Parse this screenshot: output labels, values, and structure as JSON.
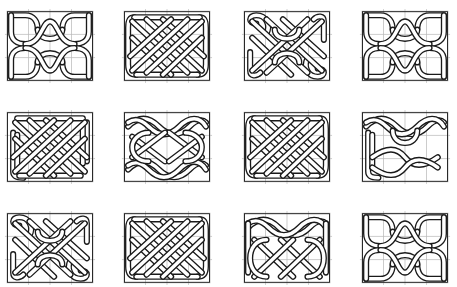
{
  "figure": {
    "title": "",
    "colors": {
      "line": "#1a1a1a",
      "band": "#ffffff",
      "grid": "#b8b8b8",
      "background": "#ffffff"
    },
    "grid": {
      "columns": 4,
      "rows": 3,
      "cell_cols": 4,
      "cell_rows": 3
    },
    "panels": [
      {
        "id": 1,
        "row": 1,
        "col": 1,
        "x": 7,
        "y": 11,
        "variant": "corner-loops-center-arcs"
      },
      {
        "id": 2,
        "row": 1,
        "col": 2,
        "x": 124,
        "y": 11,
        "variant": "diagonal-plait-framed"
      },
      {
        "id": 3,
        "row": 1,
        "col": 3,
        "x": 244,
        "y": 11,
        "variant": "spiral-ends-plait"
      },
      {
        "id": 4,
        "row": 1,
        "col": 4,
        "x": 362,
        "y": 11,
        "variant": "corner-loops-center-arcs"
      },
      {
        "id": 5,
        "row": 2,
        "col": 1,
        "x": 7,
        "y": 112,
        "variant": "side-bar-plait"
      },
      {
        "id": 6,
        "row": 2,
        "col": 2,
        "x": 124,
        "y": 112,
        "variant": "twist-rows"
      },
      {
        "id": 7,
        "row": 2,
        "col": 3,
        "x": 244,
        "y": 112,
        "variant": "diagonal-plait-framed"
      },
      {
        "id": 8,
        "row": 2,
        "col": 4,
        "x": 362,
        "y": 112,
        "variant": "top-twists-bottom-bar"
      },
      {
        "id": 9,
        "row": 3,
        "col": 1,
        "x": 7,
        "y": 213,
        "variant": "spiral-ends-plait"
      },
      {
        "id": 10,
        "row": 3,
        "col": 2,
        "x": 124,
        "y": 213,
        "variant": "diagonal-plait-framed"
      },
      {
        "id": 11,
        "row": 3,
        "col": 3,
        "x": 244,
        "y": 213,
        "variant": "top-twist-bottom-plait"
      },
      {
        "id": 12,
        "row": 3,
        "col": 4,
        "x": 362,
        "y": 213,
        "variant": "corner-loops-center-arcs"
      }
    ]
  }
}
